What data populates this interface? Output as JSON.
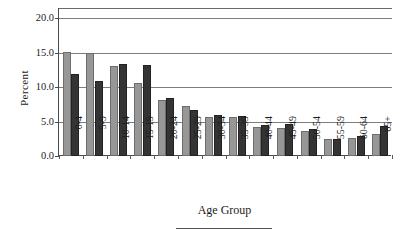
{
  "chart_data": {
    "type": "bar",
    "title": "",
    "xlabel": "Age Group",
    "ylabel": "Percent",
    "categories": [
      "0-4",
      "5-9",
      "10-14",
      "15-19",
      "20-24",
      "25-29",
      "30-34",
      "35-39",
      "40-44",
      "45-49",
      "50-54",
      "55-59",
      "60-64",
      "65+"
    ],
    "series": [
      {
        "name": "series-1",
        "color": "#979797",
        "values": [
          15.1,
          15.0,
          13.1,
          10.6,
          8.2,
          7.3,
          5.7,
          5.6,
          4.2,
          4.0,
          3.7,
          2.5,
          2.6,
          3.2
        ]
      },
      {
        "name": "series-2",
        "color": "#343434",
        "values": [
          11.9,
          10.9,
          13.3,
          13.2,
          8.4,
          6.7,
          5.9,
          5.8,
          4.5,
          4.6,
          3.9,
          2.4,
          2.9,
          4.4
        ]
      }
    ],
    "ylim": [
      0.0,
      21.5
    ],
    "yticks": [
      0.0,
      5.0,
      10.0,
      15.0,
      20.0
    ],
    "ytick_labels": [
      "0.0",
      "5.0",
      "10.0",
      "15.0",
      "20.0"
    ],
    "grid": true,
    "grid_axis": "y",
    "legend": "none",
    "xtick_rotation": -90
  }
}
